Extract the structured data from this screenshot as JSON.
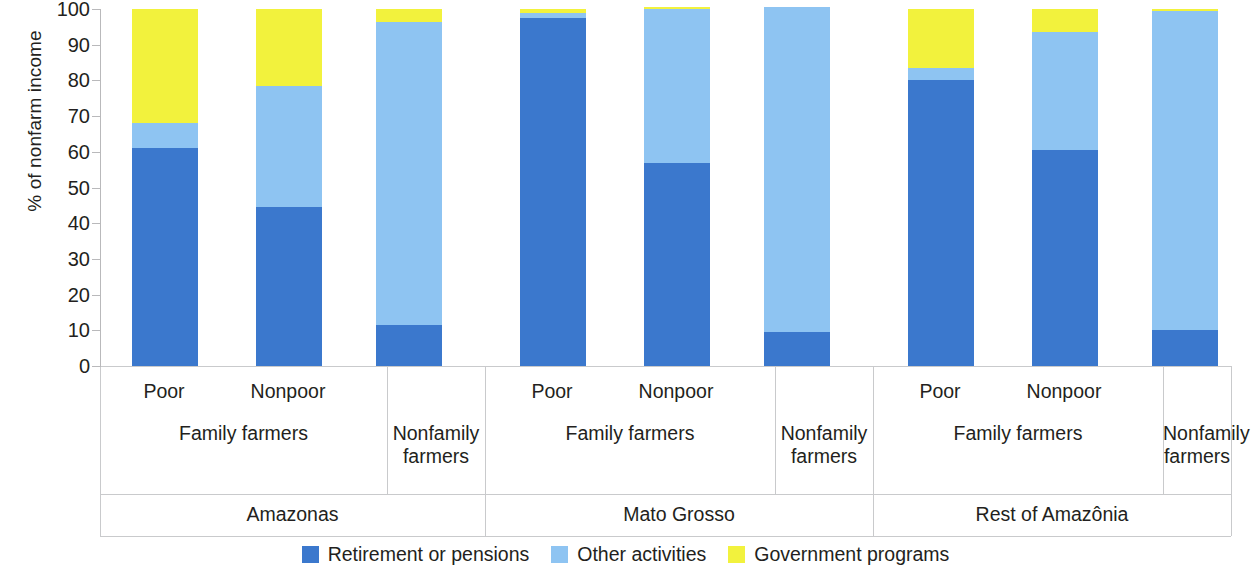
{
  "chart_data": {
    "type": "bar",
    "subtype": "stacked-100-percent",
    "title": "",
    "xlabel": "",
    "ylabel": "% of nonfarm income",
    "ylim": [
      0,
      100
    ],
    "yticks": [
      0,
      10,
      20,
      30,
      40,
      50,
      60,
      70,
      80,
      90,
      100
    ],
    "ytick_labels": [
      "0",
      "10",
      "20",
      "30",
      "40",
      "50",
      "60",
      "70",
      "80",
      "90",
      "100"
    ],
    "grid": false,
    "legend_position": "bottom-center",
    "categories": [
      "Amazonas / Family farmers / Poor",
      "Amazonas / Family farmers / Nonpoor",
      "Amazonas / Nonfamily farmers",
      "Mato Grosso / Family farmers / Poor",
      "Mato Grosso / Family farmers / Nonpoor",
      "Mato Grosso / Nonfamily farmers",
      "Rest of Amazônia / Family farmers / Poor",
      "Rest of Amazônia / Family farmers / Nonpoor",
      "Rest of Amazônia / Nonfamily farmers"
    ],
    "series": [
      {
        "name": "Retirement or pensions",
        "color": "#3b78cd",
        "values": [
          61.0,
          44.5,
          11.5,
          97.5,
          57.0,
          9.5,
          80.0,
          60.5,
          10.0
        ]
      },
      {
        "name": "Other activities",
        "color": "#8ec4f2",
        "values": [
          7.0,
          34.0,
          85.0,
          1.5,
          43.0,
          91.0,
          3.5,
          33.0,
          89.5
        ]
      },
      {
        "name": "Government programs",
        "color": "#f2f23d",
        "values": [
          32.0,
          21.5,
          3.5,
          1.0,
          0.5,
          0.0,
          16.5,
          6.5,
          0.5
        ]
      }
    ],
    "legend": [
      {
        "label": "Retirement or pensions",
        "color": "#3b78cd"
      },
      {
        "label": "Other activities",
        "color": "#8ec4f2"
      },
      {
        "label": "Government programs",
        "color": "#f2f23d"
      }
    ]
  },
  "axes": {
    "y_title": "% of nonfarm income",
    "y_ticks": [
      "100",
      "90",
      "80",
      "70",
      "60",
      "50",
      "40",
      "30",
      "20",
      "10",
      "0"
    ]
  },
  "x_labels": {
    "tier1": [
      "Poor",
      "Nonpoor",
      "Poor",
      "Nonpoor",
      "Poor",
      "Nonpoor"
    ],
    "tier2_family": "Family farmers",
    "tier2_nonfamily_line1": "Nonfamily",
    "tier2_nonfamily_line2": "farmers",
    "tier3_regions": [
      "Amazonas",
      "Mato Grosso",
      "Rest of Amazônia"
    ]
  }
}
